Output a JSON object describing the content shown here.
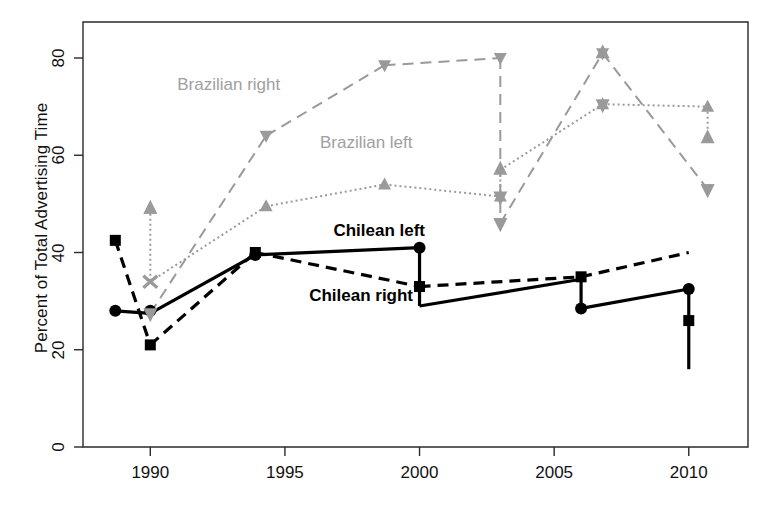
{
  "figure": {
    "axis_y_title": "Percent of Total Advertising Time",
    "background": "#ffffff"
  },
  "colors": {
    "chilean": "#000000",
    "brazilian": "#9a9a9a",
    "axis": "#1a1a1a",
    "label_gray": "#a8a8a8"
  },
  "axes": {
    "y_ticks": [
      "0",
      "20",
      "40",
      "60",
      "80"
    ],
    "y_tick_values": [
      0,
      20,
      40,
      60,
      80
    ],
    "x_ticks": [
      "1990",
      "1995",
      "2000",
      "2005",
      "2010"
    ],
    "x_tick_values": [
      1990,
      1995,
      2000,
      2005,
      2010
    ]
  },
  "annotations": [
    {
      "name": "brazilian-right-label",
      "text": "Brazilian right",
      "x": 1991.0,
      "y": 74.5,
      "style": "gray"
    },
    {
      "name": "brazilian-left-label",
      "text": "Brazilian left",
      "x": 1996.3,
      "y": 62.5,
      "style": "gray"
    },
    {
      "name": "chilean-left-label",
      "text": "Chilean left",
      "x": 1996.8,
      "y": 44.5,
      "style": "dark"
    },
    {
      "name": "chilean-right-label",
      "text": "Chilean right",
      "x": 1995.9,
      "y": 31.0,
      "style": "dark"
    }
  ],
  "chart_data": {
    "type": "line",
    "title": "",
    "xlabel": "",
    "ylabel": "Percent of Total Advertising Time",
    "xlim": [
      1988,
      2012
    ],
    "ylim": [
      -2,
      88
    ],
    "grid": false,
    "legend": "inline-annotations",
    "series": [
      {
        "name": "Brazilian right",
        "color": "#9a9a9a",
        "line": "dashed",
        "marker": "down-triangle",
        "x": [
          1990.0,
          1994.3,
          1998.7,
          2003.0,
          2003.0,
          2006.8,
          2010.7
        ],
        "values": [
          27.5,
          64.0,
          78.5,
          80.0,
          46.0,
          81.0,
          53.0
        ],
        "segments": [
          {
            "from_x": 1990.0,
            "from_y": 27.5,
            "to_x": 1994.3,
            "to_y": 64.0
          },
          {
            "from_x": 1994.3,
            "from_y": 64.0,
            "to_x": 1998.7,
            "to_y": 78.5
          },
          {
            "from_x": 1998.7,
            "from_y": 78.5,
            "to_x": 2003.0,
            "to_y": 80.0
          },
          {
            "from_x": 2003.0,
            "from_y": 80.0,
            "to_x": 2003.0,
            "to_y": 46.0
          },
          {
            "from_x": 2003.0,
            "from_y": 46.0,
            "to_x": 2006.8,
            "to_y": 81.0
          },
          {
            "from_x": 2006.8,
            "from_y": 81.0,
            "to_x": 2010.7,
            "to_y": 53.0
          }
        ]
      },
      {
        "name": "Brazilian left",
        "color": "#9a9a9a",
        "line": "dotted",
        "marker": "up-triangle",
        "x": [
          1990.0,
          1994.3,
          1998.7,
          2003.0,
          2006.8,
          2010.7
        ],
        "values": [
          49.0,
          49.5,
          54.0,
          51.5,
          70.5,
          70.0
        ],
        "segments": [
          {
            "from_x": 1990.0,
            "from_y": 49.0,
            "to_x": 1990.0,
            "to_y": 34.0
          },
          {
            "from_x": 1990.0,
            "from_y": 34.0,
            "to_x": 1994.3,
            "to_y": 49.5
          },
          {
            "from_x": 1994.3,
            "from_y": 49.5,
            "to_x": 1998.7,
            "to_y": 54.0
          },
          {
            "from_x": 1998.7,
            "from_y": 54.0,
            "to_x": 2003.0,
            "to_y": 51.5
          },
          {
            "from_x": 2003.0,
            "from_y": 51.5,
            "to_x": 2003.0,
            "to_y": 57.0
          },
          {
            "from_x": 2003.0,
            "from_y": 57.0,
            "to_x": 2006.8,
            "to_y": 70.5
          },
          {
            "from_x": 2006.8,
            "from_y": 70.5,
            "to_x": 2010.7,
            "to_y": 70.0
          },
          {
            "from_x": 2010.7,
            "from_y": 70.0,
            "to_x": 2010.7,
            "to_y": 63.5
          }
        ]
      },
      {
        "name": "Chilean left",
        "color": "#000000",
        "line": "solid",
        "marker": "circle",
        "x": [
          1988.7,
          1990.0,
          1993.9,
          2000.0,
          2006.0,
          2010.0
        ],
        "values": [
          28.0,
          28.0,
          39.5,
          41.0,
          28.5,
          32.5
        ],
        "segments": [
          {
            "from_x": 1988.7,
            "from_y": 28.0,
            "to_x": 1990.0,
            "to_y": 27.5
          },
          {
            "from_x": 1990.0,
            "from_y": 27.5,
            "to_x": 1993.9,
            "to_y": 39.5
          },
          {
            "from_x": 1993.9,
            "from_y": 39.5,
            "to_x": 2000.0,
            "to_y": 41.0
          },
          {
            "from_x": 2000.0,
            "from_y": 41.0,
            "to_x": 2000.0,
            "to_y": 29.0
          },
          {
            "from_x": 2000.0,
            "from_y": 29.0,
            "to_x": 2006.0,
            "to_y": 34.5
          },
          {
            "from_x": 2006.0,
            "from_y": 34.5,
            "to_x": 2006.0,
            "to_y": 28.5
          },
          {
            "from_x": 2006.0,
            "from_y": 28.5,
            "to_x": 2010.0,
            "to_y": 32.5
          },
          {
            "from_x": 2010.0,
            "from_y": 32.5,
            "to_x": 2010.0,
            "to_y": 16.0
          }
        ]
      },
      {
        "name": "Chilean right",
        "color": "#000000",
        "line": "dashed",
        "marker": "square",
        "x": [
          1988.7,
          1990.0,
          1993.9,
          2000.0,
          2006.0,
          2010.0
        ],
        "values": [
          42.5,
          21.0,
          40.0,
          33.0,
          35.0,
          26.0
        ],
        "segments": [
          {
            "from_x": 1988.7,
            "from_y": 42.5,
            "to_x": 1990.0,
            "to_y": 21.0
          },
          {
            "from_x": 1990.0,
            "from_y": 21.0,
            "to_x": 1993.9,
            "to_y": 40.0
          },
          {
            "from_x": 1993.9,
            "from_y": 40.0,
            "to_x": 2000.0,
            "to_y": 33.0
          },
          {
            "from_x": 2000.0,
            "from_y": 33.0,
            "to_x": 2006.0,
            "to_y": 35.0
          },
          {
            "from_x": 2006.0,
            "from_y": 35.0,
            "to_x": 2010.0,
            "to_y": 40.0
          }
        ]
      }
    ],
    "arrow_markers": [
      {
        "series": "Brazilian left",
        "x": 1990.0,
        "y": 49.0,
        "dir": "up"
      },
      {
        "series": "Brazilian left",
        "x": 1990.0,
        "y": 34.0,
        "dir": "x"
      },
      {
        "series": "Brazilian right",
        "x": 1990.0,
        "y": 27.5,
        "dir": "down"
      },
      {
        "series": "Brazilian right",
        "x": 2003.0,
        "y": 46.0,
        "dir": "down"
      },
      {
        "series": "Brazilian left",
        "x": 2003.0,
        "y": 57.0,
        "dir": "up"
      },
      {
        "series": "Brazilian left",
        "x": 2003.0,
        "y": 51.5,
        "dir": "down"
      },
      {
        "series": "Brazilian left",
        "x": 2006.8,
        "y": 81.0,
        "dir": "up"
      },
      {
        "series": "Brazilian left",
        "x": 2006.8,
        "y": 70.5,
        "dir": "down"
      },
      {
        "series": "Brazilian left",
        "x": 2010.7,
        "y": 63.5,
        "dir": "up"
      },
      {
        "series": "Brazilian right",
        "x": 2010.7,
        "y": 53.0,
        "dir": "down"
      }
    ]
  }
}
